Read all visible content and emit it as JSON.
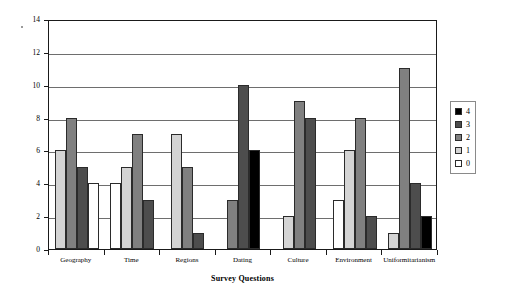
{
  "chart_data": {
    "type": "bar",
    "title": "",
    "xlabel": "Survey Questions",
    "ylabel": "Number of Students",
    "categories": [
      "Geography",
      "Time",
      "Regions",
      "Dating",
      "Culture",
      "Environment",
      "Uniformitarianism"
    ],
    "ylim": [
      0,
      14
    ],
    "y_ticks": [
      0,
      2,
      4,
      6,
      8,
      10,
      12,
      14
    ],
    "grid": "horizontal",
    "legend_position": "right",
    "series": [
      {
        "name": "4",
        "color": "#000000",
        "values": [
          null,
          null,
          null,
          6,
          null,
          null,
          2
        ]
      },
      {
        "name": "3",
        "color": "#4d4d4d",
        "values": [
          5,
          3,
          1,
          10,
          8,
          2,
          4
        ]
      },
      {
        "name": "2",
        "color": "#808080",
        "values": [
          8,
          7,
          5,
          3,
          9,
          8,
          11
        ]
      },
      {
        "name": "1",
        "color": "#d4d4d4",
        "values": [
          6,
          5,
          7,
          null,
          2,
          6,
          1
        ]
      },
      {
        "name": "0",
        "color": "#ffffff",
        "values": [
          4,
          4,
          null,
          null,
          null,
          3,
          null
        ]
      }
    ],
    "groups": [
      {
        "category": "Geography",
        "bars": [
          {
            "series": "1",
            "value": 6
          },
          {
            "series": "2",
            "value": 8
          },
          {
            "series": "3",
            "value": 5
          },
          {
            "series": "0",
            "value": 4
          }
        ]
      },
      {
        "category": "Time",
        "bars": [
          {
            "series": "0",
            "value": 4
          },
          {
            "series": "1",
            "value": 5
          },
          {
            "series": "2",
            "value": 7
          },
          {
            "series": "3",
            "value": 3
          }
        ]
      },
      {
        "category": "Regions",
        "bars": [
          {
            "series": "1",
            "value": 7
          },
          {
            "series": "2",
            "value": 5
          },
          {
            "series": "3",
            "value": 1
          }
        ]
      },
      {
        "category": "Dating",
        "bars": [
          {
            "series": "2",
            "value": 3
          },
          {
            "series": "3",
            "value": 10
          },
          {
            "series": "4",
            "value": 6
          }
        ]
      },
      {
        "category": "Culture",
        "bars": [
          {
            "series": "1",
            "value": 2
          },
          {
            "series": "2",
            "value": 9
          },
          {
            "series": "3",
            "value": 8
          }
        ]
      },
      {
        "category": "Environment",
        "bars": [
          {
            "series": "0",
            "value": 3
          },
          {
            "series": "1",
            "value": 6
          },
          {
            "series": "2",
            "value": 8
          },
          {
            "series": "3",
            "value": 2
          }
        ]
      },
      {
        "category": "Uniformitarianism",
        "bars": [
          {
            "series": "1",
            "value": 1
          },
          {
            "series": "2",
            "value": 11
          },
          {
            "series": "3",
            "value": 4
          },
          {
            "series": "4",
            "value": 2
          }
        ]
      }
    ]
  },
  "legend": {
    "entries": [
      {
        "label": "4",
        "color": "#000000"
      },
      {
        "label": "3",
        "color": "#4d4d4d"
      },
      {
        "label": "2",
        "color": "#808080"
      },
      {
        "label": "1",
        "color": "#d4d4d4"
      },
      {
        "label": "0",
        "color": "#ffffff"
      }
    ]
  }
}
